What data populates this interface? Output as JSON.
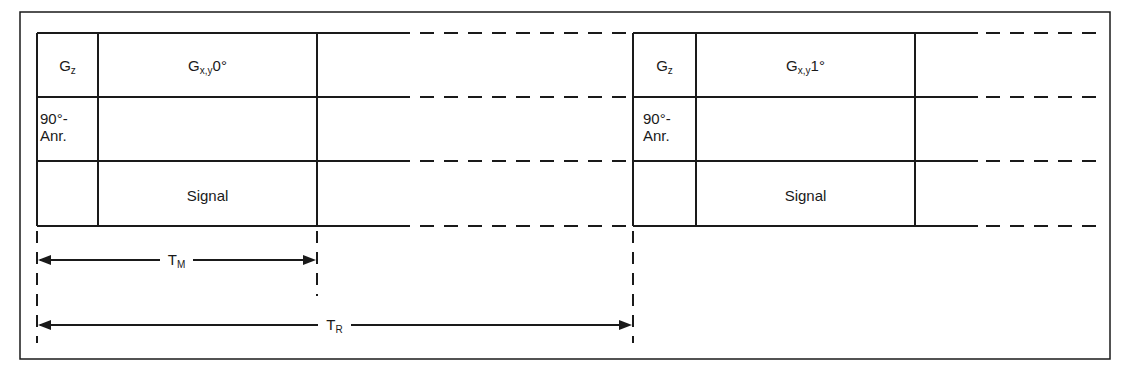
{
  "blocks": [
    {
      "gz": "G",
      "gz_sub": "z",
      "gxy": "G",
      "gxy_sub": "x,y",
      "gxy_angle": "0°",
      "pulse_line1": "90°-",
      "pulse_line2": "Anr.",
      "signal": "Signal"
    },
    {
      "gz": "G",
      "gz_sub": "z",
      "gxy": "G",
      "gxy_sub": "x,y",
      "gxy_angle": "1°",
      "pulse_line1": "90°-",
      "pulse_line2": "Anr.",
      "signal": "Signal"
    }
  ],
  "dimensions": {
    "tm": {
      "main": "T",
      "sub": "M"
    },
    "tr": {
      "main": "T",
      "sub": "R"
    }
  },
  "colors": {
    "line": "#1a1a1a",
    "background": "#ffffff"
  }
}
